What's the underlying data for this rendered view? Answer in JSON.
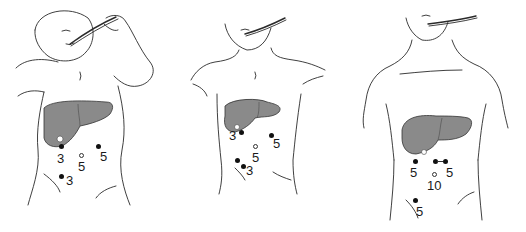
{
  "figures": [
    {
      "id": "infant",
      "ports": [
        {
          "type": "filled",
          "label": "3",
          "x": 61,
          "y": 146,
          "lx": 57,
          "ly": 152
        },
        {
          "type": "filled",
          "label": "5",
          "x": 98,
          "y": 146,
          "lx": 100,
          "ly": 150
        },
        {
          "type": "open",
          "label": "5",
          "x": 81,
          "y": 155,
          "lx": 77,
          "ly": 161
        },
        {
          "type": "filled",
          "label": "3",
          "x": 61,
          "y": 176,
          "lx": 66,
          "ly": 174
        }
      ]
    },
    {
      "id": "child",
      "ports": [
        {
          "type": "filled",
          "label": "3",
          "x": 240,
          "y": 131,
          "lx": 229,
          "ly": 129
        },
        {
          "type": "filled",
          "label": "5",
          "x": 270,
          "y": 134,
          "lx": 272,
          "ly": 137
        },
        {
          "type": "open",
          "label": "5",
          "x": 254,
          "y": 146,
          "lx": 252,
          "ly": 151
        },
        {
          "type": "filled",
          "label": "3",
          "x": 236,
          "y": 159,
          "lx": 0,
          "ly": 0
        },
        {
          "type": "filled",
          "label": "3",
          "x": 243,
          "y": 165,
          "lx": 246,
          "ly": 165
        }
      ]
    },
    {
      "id": "adolescent",
      "ports": [
        {
          "type": "filled",
          "label": "5",
          "x": 414,
          "y": 161,
          "lx": 410,
          "ly": 166
        },
        {
          "type": "filled",
          "label": "5",
          "x": 434,
          "y": 161,
          "lx": 0,
          "ly": 0
        },
        {
          "type": "filled",
          "label": "5",
          "x": 444,
          "y": 161,
          "lx": 445,
          "ly": 166
        },
        {
          "type": "open",
          "label": "10",
          "x": 433,
          "y": 174,
          "lx": 427,
          "ly": 179
        },
        {
          "type": "filled",
          "label": "5",
          "x": 414,
          "y": 200,
          "lx": 415,
          "ly": 205
        }
      ]
    }
  ],
  "colors": {
    "liver": "#8a8a8a",
    "liver_light": "#b4b4b4",
    "outline": "#2a2a2a",
    "port": "#111111"
  }
}
